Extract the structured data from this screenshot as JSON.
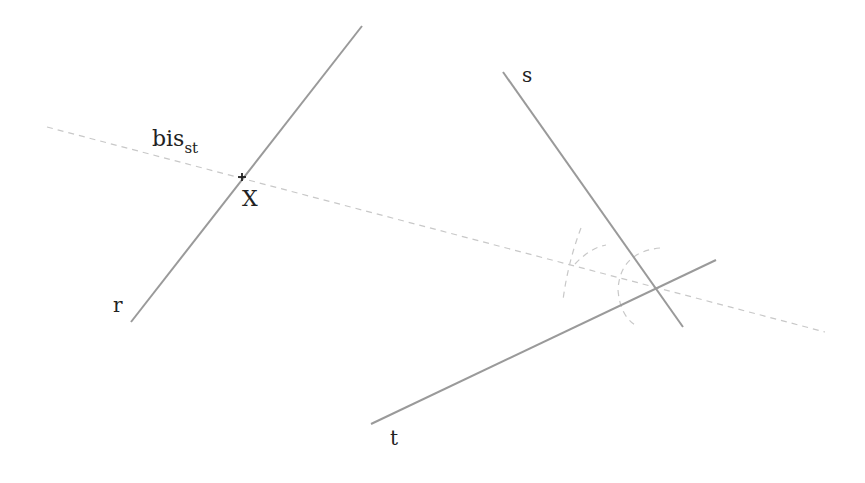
{
  "diagram": {
    "colors": {
      "line": "#9a9a9a",
      "construction": "#c8c8c8",
      "text": "#222222",
      "point": "#222222"
    },
    "lines": [
      {
        "name": "r",
        "label": "r",
        "x1": 131,
        "y1": 322,
        "x2": 362,
        "y2": 26,
        "label_x": 113,
        "label_y": 312
      },
      {
        "name": "s",
        "label": "s",
        "x1": 503,
        "y1": 72,
        "x2": 683,
        "y2": 327,
        "label_x": 522,
        "label_y": 82
      },
      {
        "name": "t",
        "label": "t",
        "x1": 371,
        "y1": 424,
        "x2": 716,
        "y2": 260,
        "label_x": 390,
        "label_y": 445
      }
    ],
    "bisector": {
      "label_main": "bis",
      "label_sub": "st",
      "x1": 47,
      "y1": 127,
      "x2": 825,
      "y2": 332,
      "label_x": 152,
      "label_y": 146
    },
    "point": {
      "label": "X",
      "x": 242,
      "y": 177,
      "label_x": 242,
      "label_y": 206
    },
    "arcs": [
      {
        "d": "M 581 228 Q 568 262 563 300"
      },
      {
        "d": "M 575 264 Q 590 248 606 245"
      },
      {
        "d": "M 660 248 Q 620 252 618 290 Q 620 315 635 325"
      }
    ]
  }
}
